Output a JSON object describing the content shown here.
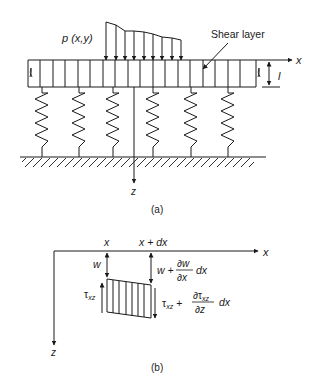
{
  "figure_a": {
    "load_label": "p (x,y)",
    "shear_layer_label": "Shear layer",
    "x_axis_label": "x",
    "z_axis_label": "z",
    "thickness_label": "l",
    "caption": "(a)",
    "num_springs": 6,
    "num_load_arrows": 9
  },
  "figure_b": {
    "x_label": "x",
    "x_plus_dx_label": "x + dx",
    "x_axis_label": "x",
    "z_axis_label": "z",
    "w_label": "w",
    "w_plus": "w +",
    "dw": "∂w",
    "dx_frac": "∂x",
    "dx_tail": "dx",
    "tau_label": "τ",
    "tau_sub": "xz",
    "tau_plus": "+",
    "dtau": "∂τ",
    "dtau_sub": "xz",
    "dz": "∂z",
    "dtau_tail": "dx",
    "caption": "(b)"
  },
  "colors": {
    "ink": "#1a1a1a",
    "background": "#ffffff"
  }
}
